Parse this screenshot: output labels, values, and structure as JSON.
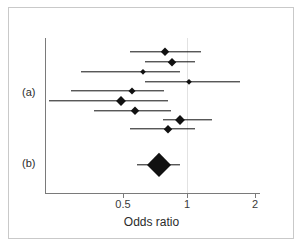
{
  "figure": {
    "type": "forest-plot",
    "x_axis_title": "Odds ratio",
    "group_labels": [
      {
        "id": "a",
        "label": "(a)"
      },
      {
        "id": "b",
        "label": "(b)"
      }
    ],
    "tick_labels": [
      "0.5",
      "1",
      "2"
    ],
    "colors": {
      "marker": "#111111",
      "axis": "#7a7a7a",
      "frame": "#c9c9c9",
      "text": "#2b2b2b",
      "background": "#ffffff"
    }
  },
  "chart_data": {
    "type": "scatter",
    "title": "",
    "subtitle": "",
    "xlabel": "Odds ratio",
    "ylabel": "",
    "xscale": "log",
    "xlim": [
      0.18,
      2.35
    ],
    "xticks": [
      0.5,
      1,
      2
    ],
    "xticklabels": [
      "0.5",
      "1",
      "2"
    ],
    "grid": false,
    "legend": "none",
    "annotations": [
      "(a)",
      "(b)"
    ],
    "series": [
      {
        "name": "(a) individual studies",
        "group": "a",
        "marker": "diamond",
        "points": [
          {
            "row": 1,
            "estimate": 0.78,
            "ci_low": 0.54,
            "ci_high": 1.13,
            "marker_size": 9
          },
          {
            "row": 2,
            "estimate": 0.84,
            "ci_low": 0.63,
            "ci_high": 1.07,
            "marker_size": 8
          },
          {
            "row": 3,
            "estimate": 0.62,
            "ci_low": 0.32,
            "ci_high": 0.91,
            "marker_size": 6
          },
          {
            "row": 4,
            "estimate": 1.0,
            "ci_low": 0.63,
            "ci_high": 1.7,
            "marker_size": 6
          },
          {
            "row": 5,
            "estimate": 0.55,
            "ci_low": 0.29,
            "ci_high": 0.77,
            "marker_size": 7
          },
          {
            "row": 6,
            "estimate": 0.49,
            "ci_low": 0.23,
            "ci_high": 0.8,
            "marker_size": 10
          },
          {
            "row": 7,
            "estimate": 0.57,
            "ci_low": 0.37,
            "ci_high": 0.83,
            "marker_size": 9
          },
          {
            "row": 8,
            "estimate": 0.91,
            "ci_low": 0.76,
            "ci_high": 1.28,
            "marker_size": 10
          },
          {
            "row": 9,
            "estimate": 0.8,
            "ci_low": 0.54,
            "ci_high": 1.07,
            "marker_size": 8
          }
        ]
      },
      {
        "name": "(b) pooled summary",
        "group": "b",
        "marker": "large-diamond",
        "points": [
          {
            "row": 10,
            "estimate": 0.73,
            "ci_low": 0.58,
            "ci_high": 0.91,
            "marker_size": 22
          }
        ]
      }
    ]
  }
}
